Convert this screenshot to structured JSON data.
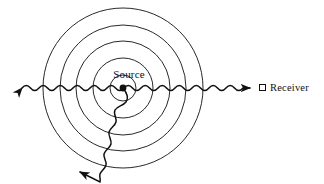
{
  "figure": {
    "type": "wave-propagation-diagram",
    "background_color": "#ffffff",
    "stroke_color": "#111111",
    "source": {
      "label": "Source",
      "marker": "filled-dot",
      "x": 123,
      "y": 88
    },
    "legend": {
      "marker": "open-square",
      "label": "Receiver"
    },
    "wavefronts": {
      "description": "concentric circular wavefronts centered on the source",
      "count": 5,
      "radii": [
        13,
        30,
        47,
        63,
        80
      ]
    },
    "rays": [
      {
        "name": "horizontal-ray",
        "description": "sinusoidal ray through the source, arrowheads at both ends",
        "direction": "horizontal",
        "arrow_left": true,
        "arrow_right": true,
        "y": 88,
        "x_start": 20,
        "x_end": 252,
        "amplitude": 5,
        "wavelength": 17
      },
      {
        "name": "down-left-ray",
        "description": "sinusoidal ray from the source toward the lower left, arrowhead at far end",
        "direction": "down-left",
        "arrow_end": true,
        "x_start": 123,
        "y_start": 88,
        "x_end": 78,
        "y_end": 174,
        "amplitude": 5,
        "wavelength": 17
      }
    ]
  }
}
